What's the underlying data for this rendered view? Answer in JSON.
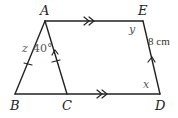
{
  "diagram": {
    "title": "",
    "vertices": {
      "A": {
        "label": "A",
        "x": 45,
        "y": 21
      },
      "E": {
        "label": "E",
        "x": 143,
        "y": 21
      },
      "B": {
        "label": "B",
        "x": 15,
        "y": 94
      },
      "C": {
        "label": "C",
        "x": 67,
        "y": 94
      },
      "D": {
        "label": "D",
        "x": 160,
        "y": 94
      }
    },
    "segments": [
      "AE",
      "AB",
      "AC",
      "BD",
      "ED"
    ],
    "angle_labels": {
      "z": "z",
      "angle_40": "40°",
      "y": "y",
      "x": "x"
    },
    "measurements": {
      "ED": "8 cm"
    },
    "markings": {
      "AE": "double-arrow (parallel)",
      "BD": "double-arrow (parallel)",
      "AC": "single-arrow + tick",
      "ED": "single-arrow",
      "AB": "single tick"
    }
  }
}
